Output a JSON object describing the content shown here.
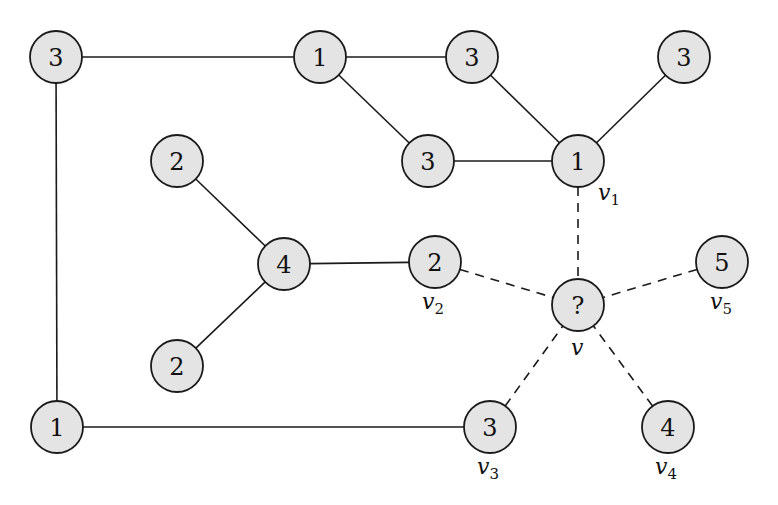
{
  "diagram": {
    "type": "graph",
    "node_radius": 26,
    "colors": {
      "node_fill": "#e4e4e4",
      "stroke": "#1a1a1a"
    },
    "nodes": [
      {
        "id": "A",
        "label": "3",
        "x": 56,
        "y": 57
      },
      {
        "id": "B",
        "label": "1",
        "x": 320,
        "y": 57
      },
      {
        "id": "C",
        "label": "3",
        "x": 472,
        "y": 57
      },
      {
        "id": "D",
        "label": "3",
        "x": 684,
        "y": 57
      },
      {
        "id": "E",
        "label": "3",
        "x": 428,
        "y": 161
      },
      {
        "id": "F",
        "label": "1",
        "x": 578,
        "y": 161,
        "name": "v",
        "sub": "1",
        "lx": 598,
        "ly": 200
      },
      {
        "id": "G",
        "label": "2",
        "x": 177,
        "y": 161
      },
      {
        "id": "H",
        "label": "4",
        "x": 284,
        "y": 264
      },
      {
        "id": "I",
        "label": "2",
        "x": 435,
        "y": 262,
        "name": "v",
        "sub": "2",
        "lx": 422,
        "ly": 309
      },
      {
        "id": "J",
        "label": "?",
        "x": 578,
        "y": 305,
        "name": "v",
        "sub": "",
        "lx": 571,
        "ly": 355
      },
      {
        "id": "K",
        "label": "5",
        "x": 722,
        "y": 262,
        "name": "v",
        "sub": "5",
        "lx": 710,
        "ly": 309
      },
      {
        "id": "L",
        "label": "2",
        "x": 177,
        "y": 366
      },
      {
        "id": "M",
        "label": "1",
        "x": 57,
        "y": 427
      },
      {
        "id": "N",
        "label": "3",
        "x": 490,
        "y": 427,
        "name": "v",
        "sub": "3",
        "lx": 477,
        "ly": 474
      },
      {
        "id": "O",
        "label": "4",
        "x": 668,
        "y": 427,
        "name": "v",
        "sub": "4",
        "lx": 655,
        "ly": 474
      }
    ],
    "edges": [
      {
        "from": "A",
        "to": "B",
        "style": "solid"
      },
      {
        "from": "B",
        "to": "C",
        "style": "solid"
      },
      {
        "from": "B",
        "to": "E",
        "style": "solid"
      },
      {
        "from": "C",
        "to": "F",
        "style": "solid"
      },
      {
        "from": "D",
        "to": "F",
        "style": "solid"
      },
      {
        "from": "E",
        "to": "F",
        "style": "solid"
      },
      {
        "from": "A",
        "to": "M",
        "style": "solid"
      },
      {
        "from": "M",
        "to": "N",
        "style": "solid"
      },
      {
        "from": "G",
        "to": "H",
        "style": "solid"
      },
      {
        "from": "L",
        "to": "H",
        "style": "solid"
      },
      {
        "from": "H",
        "to": "I",
        "style": "solid"
      },
      {
        "from": "F",
        "to": "J",
        "style": "dashed"
      },
      {
        "from": "I",
        "to": "J",
        "style": "dashed"
      },
      {
        "from": "K",
        "to": "J",
        "style": "dashed"
      },
      {
        "from": "N",
        "to": "J",
        "style": "dashed"
      },
      {
        "from": "O",
        "to": "J",
        "style": "dashed"
      }
    ]
  }
}
